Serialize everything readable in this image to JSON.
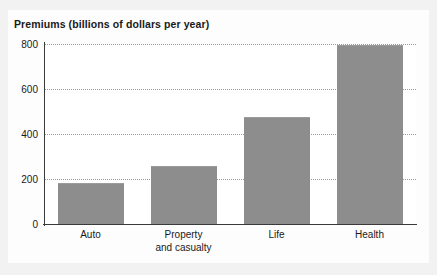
{
  "chart_data": {
    "type": "bar",
    "title": "Premiums (billions of dollars per year)",
    "xlabel": "",
    "ylabel": "Premiums (billions of dollars per year)",
    "categories": [
      "Auto",
      "Property and casualty",
      "Life",
      "Health"
    ],
    "category_lines": [
      [
        "Auto",
        ""
      ],
      [
        "Property",
        "and casualty"
      ],
      [
        "Life",
        ""
      ],
      [
        "Health",
        ""
      ]
    ],
    "values": [
      180,
      255,
      470,
      790
    ],
    "ylim": [
      0,
      800
    ],
    "yticks": [
      0,
      200,
      400,
      600,
      800
    ],
    "ytick_labels": [
      "0",
      "200",
      "400",
      "600",
      "800"
    ],
    "grid": true,
    "grid_style": "dotted-horizontal",
    "legend": "none",
    "bar_color": "#8d8d8d",
    "axis_color": "#3a3a3a",
    "grid_color": "#9a9a9a",
    "background_color": "#f2f2f2",
    "plot_background_color": "#ffffff"
  }
}
